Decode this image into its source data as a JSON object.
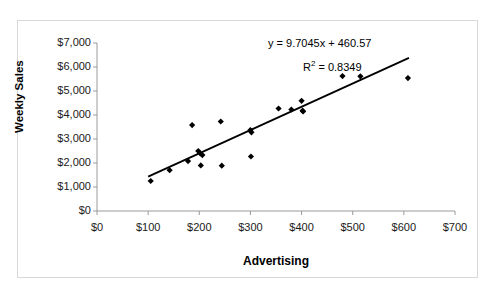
{
  "chart_data": {
    "type": "scatter",
    "title": "",
    "xlabel": "Advertising",
    "ylabel": "Weekly Sales",
    "xlim": [
      0,
      700
    ],
    "ylim": [
      0,
      7000
    ],
    "xticks": [
      "$0",
      "$100",
      "$200",
      "$300",
      "$400",
      "$500",
      "$600",
      "$700"
    ],
    "xtick_values": [
      0,
      100,
      200,
      300,
      400,
      500,
      600,
      700
    ],
    "yticks": [
      "$0",
      "$1,000",
      "$2,000",
      "$3,000",
      "$4,000",
      "$5,000",
      "$6,000",
      "$7,000"
    ],
    "ytick_values": [
      0,
      1000,
      2000,
      3000,
      4000,
      5000,
      6000,
      7000
    ],
    "grid": false,
    "legend": null,
    "marker": "diamond",
    "marker_color": "#000000",
    "points": [
      {
        "x": 105,
        "y": 1250
      },
      {
        "x": 142,
        "y": 1700
      },
      {
        "x": 178,
        "y": 2080
      },
      {
        "x": 186,
        "y": 3580
      },
      {
        "x": 198,
        "y": 2500
      },
      {
        "x": 202,
        "y": 2400
      },
      {
        "x": 206,
        "y": 2330
      },
      {
        "x": 203,
        "y": 1900
      },
      {
        "x": 242,
        "y": 3730
      },
      {
        "x": 244,
        "y": 1890
      },
      {
        "x": 300,
        "y": 3370
      },
      {
        "x": 302,
        "y": 3280
      },
      {
        "x": 301,
        "y": 2270
      },
      {
        "x": 355,
        "y": 4270
      },
      {
        "x": 380,
        "y": 4230
      },
      {
        "x": 400,
        "y": 4590
      },
      {
        "x": 402,
        "y": 4180
      },
      {
        "x": 403,
        "y": 4150
      },
      {
        "x": 480,
        "y": 5620
      },
      {
        "x": 515,
        "y": 5610
      },
      {
        "x": 608,
        "y": 5540
      }
    ],
    "trendline": {
      "equation": "y = 9.7045x + 460.57",
      "r_squared_label": "R",
      "r_squared_exponent": "2",
      "r_squared_value": "= 0.8349",
      "slope": 9.7045,
      "intercept": 460.57,
      "r_squared": 0.8349,
      "color": "#000000",
      "x_start": 100,
      "x_end": 610
    }
  }
}
